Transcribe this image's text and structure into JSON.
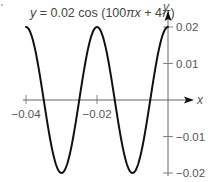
{
  "chart_data": {
    "type": "line",
    "title": "y = 0.02 cos (100πx + 4π)",
    "equation": {
      "parts": [
        {
          "text": "y",
          "italic": true
        },
        {
          "text": " = 0.02 cos (100",
          "italic": false
        },
        {
          "text": "πx",
          "italic": true
        },
        {
          "text": " + 4",
          "italic": false
        },
        {
          "text": "π",
          "italic": true
        },
        {
          "text": ")",
          "italic": false
        }
      ]
    },
    "function": {
      "amplitude": 0.02,
      "angular_coefficient_pi": 100,
      "phase_pi": 4
    },
    "xlabel": "x",
    "ylabel": "y",
    "xlim": [
      -0.04,
      0.0
    ],
    "ylim": [
      -0.02,
      0.02
    ],
    "x_ticks": [
      {
        "value": -0.04,
        "label": "−0.04"
      },
      {
        "value": -0.02,
        "label": "−0.02"
      }
    ],
    "y_ticks": [
      {
        "value": 0.02,
        "label": "0.02"
      },
      {
        "value": 0.01,
        "label": "0.01"
      },
      {
        "value": -0.01,
        "label": "−0.01"
      },
      {
        "value": -0.02,
        "label": "−0.02"
      }
    ],
    "series": [
      {
        "name": "y = 0.02 cos (100πx + 4π)",
        "x": [
          -0.04,
          -0.035,
          -0.03,
          -0.025,
          -0.02,
          -0.015,
          -0.01,
          -0.005,
          0.0
        ],
        "y": [
          0.02,
          0.0,
          -0.02,
          0.0,
          0.02,
          0.0,
          -0.02,
          0.0,
          0.02
        ]
      }
    ],
    "grid": false,
    "legend": "none"
  }
}
